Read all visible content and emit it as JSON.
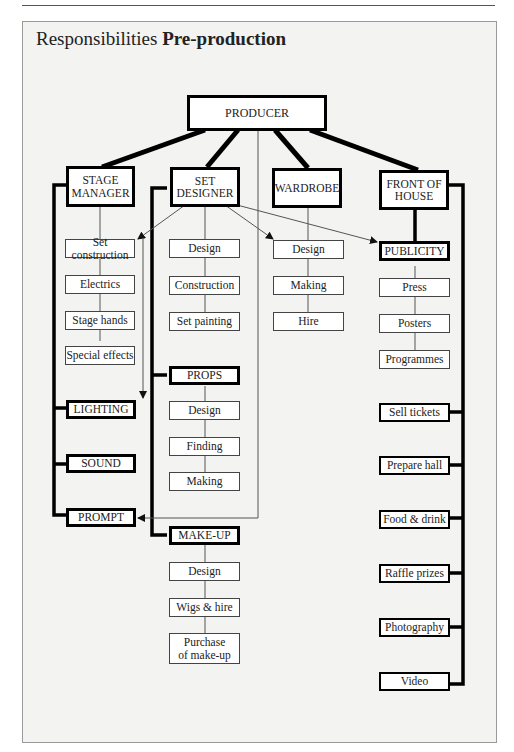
{
  "title": {
    "normal": "Responsibilities ",
    "bold": "Pre-production"
  },
  "root": {
    "label": "PRODUCER"
  },
  "departments": [
    {
      "label": "STAGE MANAGER",
      "items": [
        "Set construction",
        "Electrics",
        "Stage hands",
        "Special effects"
      ],
      "sub": [
        "LIGHTING",
        "SOUND",
        "PROMPT"
      ]
    },
    {
      "label": "SET DESIGNER",
      "items": [
        "Design",
        "Construction",
        "Set painting"
      ],
      "props": {
        "label": "PROPS",
        "items": [
          "Design",
          "Finding",
          "Making"
        ]
      },
      "makeup": {
        "label": "MAKE-UP",
        "items": [
          "Design",
          "Wigs & hire",
          "Purchase of make-up"
        ]
      }
    },
    {
      "label": "WARDROBE",
      "items": [
        "Design",
        "Making",
        "Hire"
      ]
    },
    {
      "label": "FRONT OF HOUSE",
      "publicity": {
        "label": "PUBLICITY",
        "items": [
          "Press",
          "Posters",
          "Programmes"
        ]
      },
      "tasks": [
        "Sell tickets",
        "Prepare hall",
        "Food & drink",
        "Raffle prizes",
        "Photography",
        "Video"
      ]
    }
  ]
}
